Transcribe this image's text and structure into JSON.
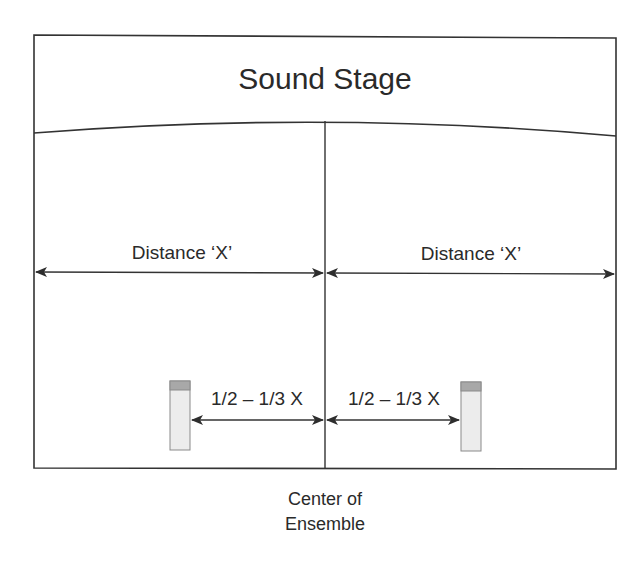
{
  "diagram": {
    "title": "Sound Stage",
    "colors": {
      "line": "#333333",
      "mic_body": "#ececec",
      "mic_cap": "#a8a8a8",
      "mic_border": "#8a8a8a",
      "text": "#2a2a2a"
    },
    "distance_labels": {
      "left": "Distance ‘X’",
      "right": "Distance ‘X’"
    },
    "mic_spacing_labels": {
      "left": "1/2 – 1/3 X",
      "right": "1/2 – 1/3 X"
    },
    "center_label": {
      "line1": "Center of",
      "line2": "Ensemble"
    },
    "microphones": [
      {
        "id": "left-mic",
        "position": "left"
      },
      {
        "id": "right-mic",
        "position": "right"
      }
    ]
  }
}
